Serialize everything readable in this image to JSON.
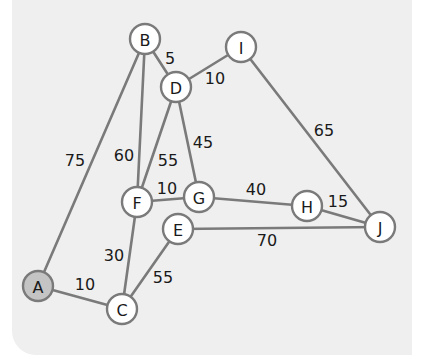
{
  "graph": {
    "start_node": "A",
    "colors": {
      "background": "#efefef",
      "edge": "#7a7a7a",
      "node_fill": "#ffffff",
      "start_node_fill": "#c4c4c4",
      "text": "#1a1a1a"
    },
    "nodes": [
      {
        "id": "A",
        "label": "A",
        "x": 38,
        "y": 286
      },
      {
        "id": "B",
        "label": "B",
        "x": 145,
        "y": 39
      },
      {
        "id": "C",
        "label": "C",
        "x": 122,
        "y": 309
      },
      {
        "id": "D",
        "label": "D",
        "x": 176,
        "y": 87
      },
      {
        "id": "E",
        "label": "E",
        "x": 178,
        "y": 229
      },
      {
        "id": "F",
        "label": "F",
        "x": 137,
        "y": 202
      },
      {
        "id": "G",
        "label": "G",
        "x": 199,
        "y": 197
      },
      {
        "id": "H",
        "label": "H",
        "x": 307,
        "y": 206
      },
      {
        "id": "I",
        "label": "I",
        "x": 241,
        "y": 47
      },
      {
        "id": "J",
        "label": "J",
        "x": 380,
        "y": 227
      }
    ],
    "edges": [
      {
        "from": "A",
        "to": "B",
        "weight": "75",
        "lx": 75,
        "ly": 160
      },
      {
        "from": "A",
        "to": "C",
        "weight": "10",
        "lx": 85,
        "ly": 284
      },
      {
        "from": "B",
        "to": "D",
        "weight": "5",
        "lx": 170,
        "ly": 58
      },
      {
        "from": "B",
        "to": "F",
        "weight": "60",
        "lx": 124,
        "ly": 155
      },
      {
        "from": "D",
        "to": "I",
        "weight": "10",
        "lx": 215,
        "ly": 78
      },
      {
        "from": "D",
        "to": "F",
        "weight": "55",
        "lx": 168,
        "ly": 160
      },
      {
        "from": "D",
        "to": "G",
        "weight": "45",
        "lx": 203,
        "ly": 142
      },
      {
        "from": "F",
        "to": "G",
        "weight": "10",
        "lx": 167,
        "ly": 188
      },
      {
        "from": "F",
        "to": "C",
        "weight": "30",
        "lx": 114,
        "ly": 255
      },
      {
        "from": "G",
        "to": "H",
        "weight": "40",
        "lx": 256,
        "ly": 189
      },
      {
        "from": "H",
        "to": "J",
        "weight": "15",
        "lx": 338,
        "ly": 201
      },
      {
        "from": "I",
        "to": "J",
        "weight": "65",
        "lx": 324,
        "ly": 130
      },
      {
        "from": "E",
        "to": "J",
        "weight": "70",
        "lx": 267,
        "ly": 240
      },
      {
        "from": "C",
        "to": "E",
        "weight": "55",
        "lx": 163,
        "ly": 277
      }
    ]
  }
}
